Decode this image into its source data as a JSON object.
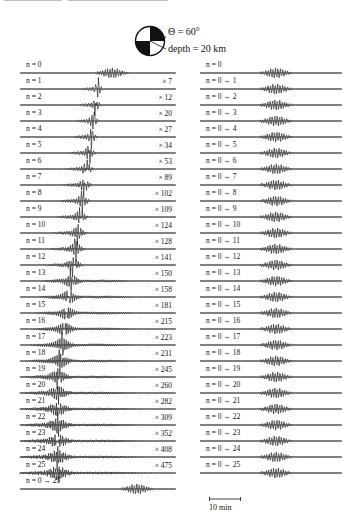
{
  "figure": {
    "source_parameters": {
      "theta_label": "Θ = 60°",
      "depth_label": "depth = 20 km",
      "beachball_icon": "focal-mechanism-beachball"
    },
    "left_column": {
      "title": "individual overtone seismograms",
      "rows": [
        {
          "label": "n = 0",
          "factor": ""
        },
        {
          "label": "n = 1",
          "factor": "× 7"
        },
        {
          "label": "n = 2",
          "factor": "× 12"
        },
        {
          "label": "n = 3",
          "factor": "× 20"
        },
        {
          "label": "n = 4",
          "factor": "× 27"
        },
        {
          "label": "n = 5",
          "factor": "× 34"
        },
        {
          "label": "n = 6",
          "factor": "× 53"
        },
        {
          "label": "n = 7",
          "factor": "× 89"
        },
        {
          "label": "n = 8",
          "factor": "× 102"
        },
        {
          "label": "n = 9",
          "factor": "× 109"
        },
        {
          "label": "n = 10",
          "factor": "× 124"
        },
        {
          "label": "n = 11",
          "factor": "× 128"
        },
        {
          "label": "n = 12",
          "factor": "× 141"
        },
        {
          "label": "n = 13",
          "factor": "× 150"
        },
        {
          "label": "n = 14",
          "factor": "× 158"
        },
        {
          "label": "n = 15",
          "factor": "× 181"
        },
        {
          "label": "n = 16",
          "factor": "× 215"
        },
        {
          "label": "n = 17",
          "factor": "× 223"
        },
        {
          "label": "n = 18",
          "factor": "× 231"
        },
        {
          "label": "n = 19",
          "factor": "× 245"
        },
        {
          "label": "n = 20",
          "factor": "× 260"
        },
        {
          "label": "n = 21",
          "factor": "× 282"
        },
        {
          "label": "n = 22",
          "factor": "× 309"
        },
        {
          "label": "n = 23",
          "factor": "× 352"
        },
        {
          "label": "n = 24",
          "factor": "× 408"
        },
        {
          "label": "n = 25",
          "factor": "× 475"
        },
        {
          "label": "n = 0 → 25",
          "factor": ""
        }
      ]
    },
    "right_column": {
      "title": "cumulative overtone sums",
      "rows": [
        {
          "label": "n = 0"
        },
        {
          "label": "n = 0 → 1"
        },
        {
          "label": "n = 0 → 2"
        },
        {
          "label": "n = 0 → 3"
        },
        {
          "label": "n = 0 → 4"
        },
        {
          "label": "n = 0 → 5"
        },
        {
          "label": "n = 0 → 6"
        },
        {
          "label": "n = 0 → 7"
        },
        {
          "label": "n = 0 → 8"
        },
        {
          "label": "n = 0 → 9"
        },
        {
          "label": "n = 0 → 10"
        },
        {
          "label": "n = 0 → 11"
        },
        {
          "label": "n = 0 → 12"
        },
        {
          "label": "n = 0 → 13"
        },
        {
          "label": "n = 0 → 14"
        },
        {
          "label": "n = 0 → 15"
        },
        {
          "label": "n = 0 → 16"
        },
        {
          "label": "n = 0 → 17"
        },
        {
          "label": "n = 0 → 18"
        },
        {
          "label": "n = 0 → 19"
        },
        {
          "label": "n = 0 → 20"
        },
        {
          "label": "n = 0 → 21"
        },
        {
          "label": "n = 0 → 22"
        },
        {
          "label": "n = 0 → 23"
        },
        {
          "label": "n = 0 → 24"
        },
        {
          "label": "n = 0 → 25"
        }
      ]
    },
    "scale_bar": {
      "label": "10 min"
    }
  }
}
